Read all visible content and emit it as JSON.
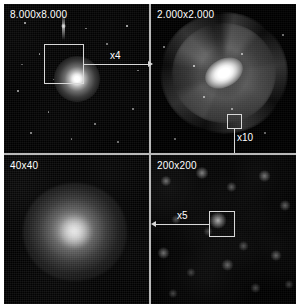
{
  "figure": {
    "kind": "astronomical-zoom-mosaic",
    "layout": "2x2 grid of square image panels",
    "background_color": "#000000",
    "annotation_color": "#d8d8d8",
    "panels": [
      {
        "id": "wide-field",
        "position": "top-left",
        "label": "8.000x8.000",
        "content": "wide-field star field with one bright compact source at center",
        "callout": {
          "factor_label": "x4",
          "direction": "right",
          "target": "top-right"
        }
      },
      {
        "id": "spiral-galaxy",
        "position": "top-right",
        "label": "2.000x2.000",
        "content": "face-on spiral galaxy with bright elongated bulge and multiple arms",
        "callout": {
          "factor_label": "x10",
          "direction": "down",
          "target": "bottom-right"
        }
      },
      {
        "id": "nucleus-blob",
        "position": "bottom-left",
        "label": "40x40",
        "content": "diffuse unresolved glow filling the frame",
        "callout": null
      },
      {
        "id": "faint-field",
        "position": "bottom-right",
        "label": "200x200",
        "content": "faint diffuse sources on noisy background, boxed source right of center",
        "callout": {
          "factor_label": "x5",
          "direction": "left",
          "target": "bottom-left"
        }
      }
    ],
    "zoom_factors": [
      "x4",
      "x10",
      "x5"
    ]
  }
}
